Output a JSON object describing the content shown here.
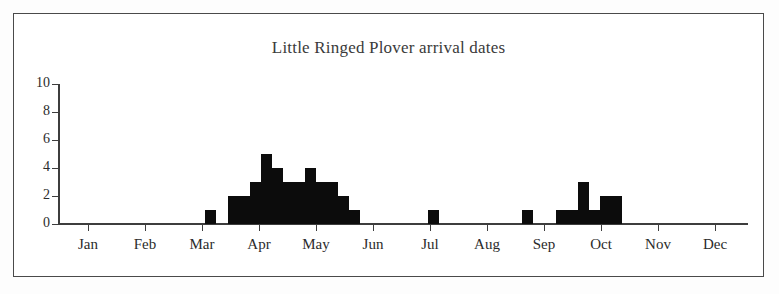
{
  "chart_data": {
    "type": "bar",
    "title": "Little Ringed Plover arrival dates",
    "xlabel": "",
    "ylabel": "",
    "ylim": [
      0,
      10
    ],
    "yticks": [
      0,
      2,
      4,
      6,
      8,
      10
    ],
    "ytick_labels": [
      "0",
      "2",
      "4",
      "6",
      "8",
      "10"
    ],
    "grid": false,
    "legend": "none",
    "bar_color": "#0c0c0c",
    "xlim_months": [
      "Jan",
      "Dec"
    ],
    "categories": [
      "Jan",
      "Feb",
      "Mar",
      "Apr",
      "May",
      "Jun",
      "Jul",
      "Aug",
      "Sep",
      "Oct",
      "Nov",
      "Dec"
    ],
    "xtick_labels": [
      "Jan",
      "Feb",
      "Mar",
      "Apr",
      "May",
      "Jun",
      "Jul",
      "Aug",
      "Sep",
      "Oct",
      "Nov",
      "Dec"
    ],
    "bin_description": "Counts per ~weekly bin across the year; empty bins are not drawn.",
    "bins": [
      {
        "x": 205,
        "value": 1,
        "period": "mid Mar"
      },
      {
        "x": 228,
        "value": 2,
        "period": "late Mar"
      },
      {
        "x": 239,
        "value": 2,
        "period": "late Mar"
      },
      {
        "x": 250,
        "value": 3,
        "period": "early Apr"
      },
      {
        "x": 261,
        "value": 5,
        "period": "early Apr"
      },
      {
        "x": 272,
        "value": 4,
        "period": "mid Apr"
      },
      {
        "x": 283,
        "value": 3,
        "period": "mid Apr"
      },
      {
        "x": 294,
        "value": 3,
        "period": "late Apr"
      },
      {
        "x": 305,
        "value": 4,
        "period": "late Apr"
      },
      {
        "x": 316,
        "value": 3,
        "period": "early May"
      },
      {
        "x": 327,
        "value": 3,
        "period": "early May"
      },
      {
        "x": 338,
        "value": 2,
        "period": "mid May"
      },
      {
        "x": 349,
        "value": 1,
        "period": "mid May"
      },
      {
        "x": 428,
        "value": 1,
        "period": "early Jul"
      },
      {
        "x": 522,
        "value": 1,
        "period": "late Aug"
      },
      {
        "x": 556,
        "value": 1,
        "period": "mid Sep"
      },
      {
        "x": 567,
        "value": 1,
        "period": "mid Sep"
      },
      {
        "x": 578,
        "value": 3,
        "period": "late Sep"
      },
      {
        "x": 589,
        "value": 1,
        "period": "late Sep"
      },
      {
        "x": 600,
        "value": 2,
        "period": "early Oct"
      },
      {
        "x": 611,
        "value": 2,
        "period": "early Oct"
      }
    ]
  },
  "axis": {
    "y_px_baseline": 224,
    "y_px_per_unit": 14,
    "x_px_start": 58,
    "x_px_end": 748,
    "bar_width_px": 11,
    "month_tick_x": [
      88,
      145,
      202,
      259,
      316,
      373,
      430,
      487,
      544,
      601,
      658,
      715
    ]
  }
}
